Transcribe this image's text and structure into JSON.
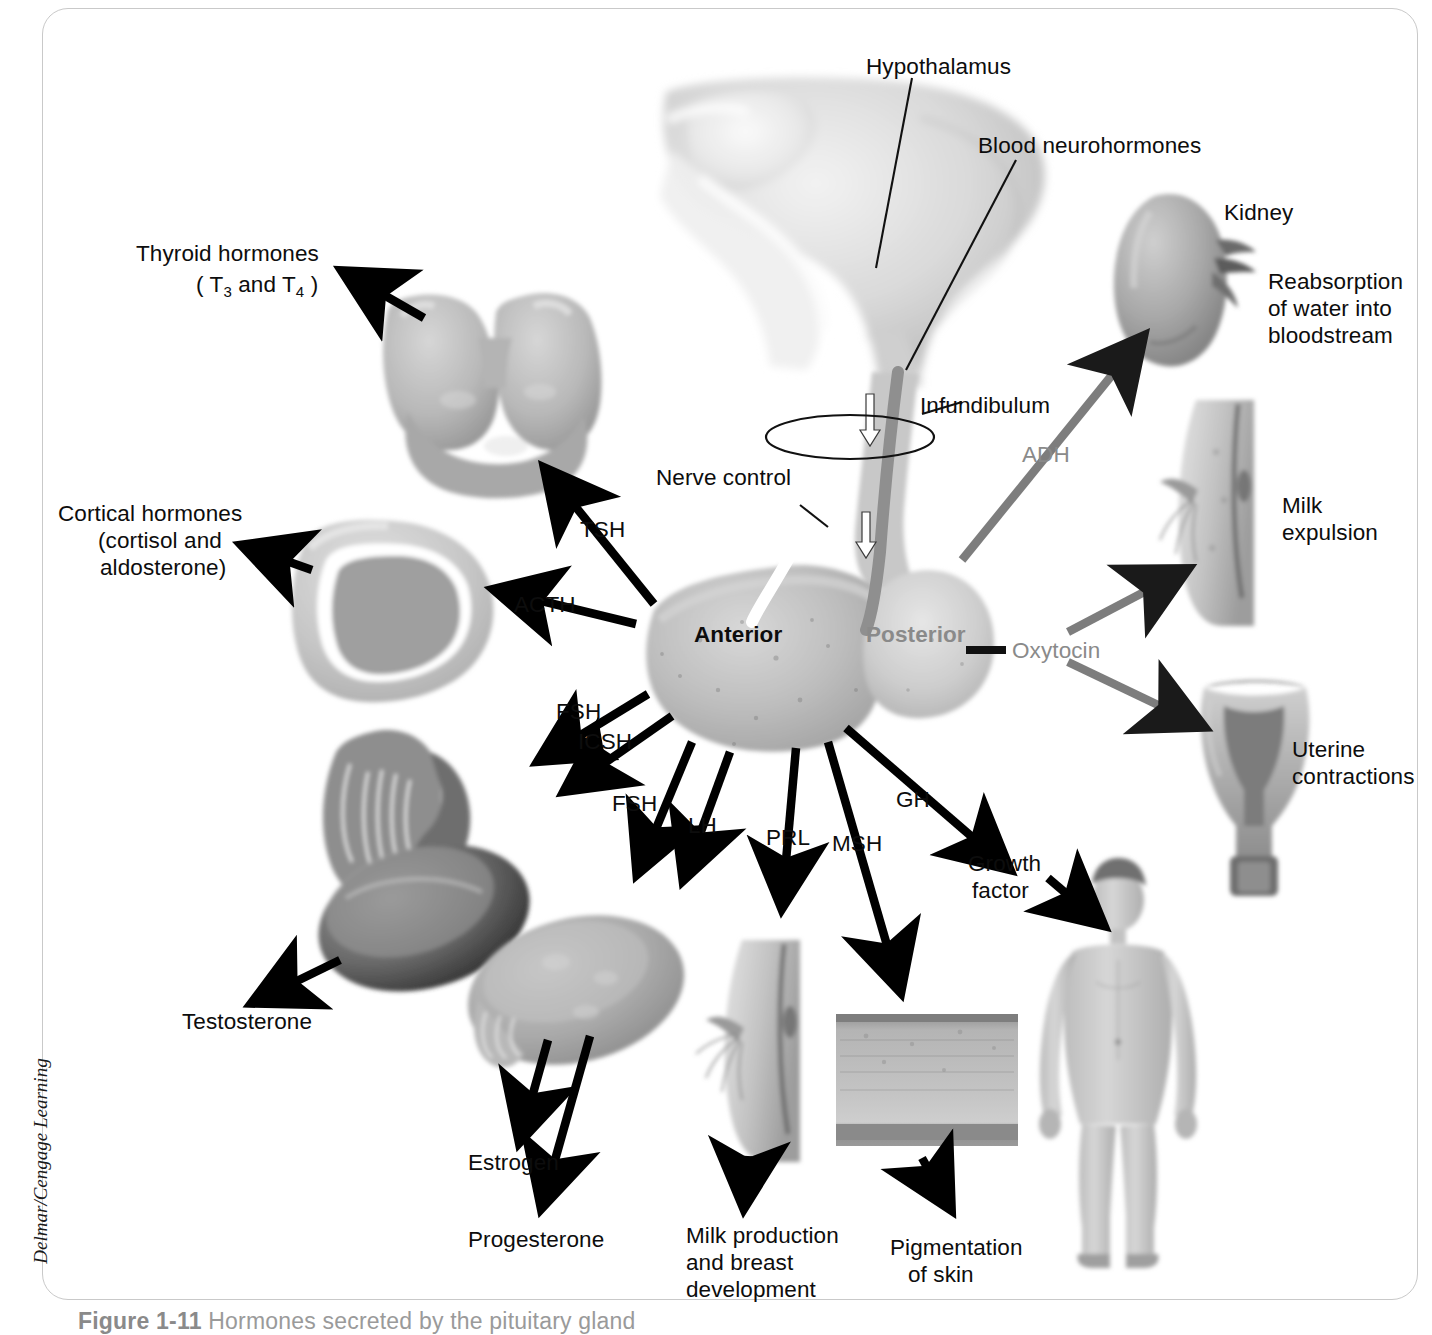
{
  "figure": {
    "credit": "Delmar/Cengage Learning",
    "caption_number": "Figure 1-11",
    "caption_text": "Hormones secreted by the pituitary gland"
  },
  "colors": {
    "ink": "#0d0d0d",
    "posterior_gray": "#8a8a8a",
    "anterior_black": "#0d0d0d",
    "arrow_black": "#000000",
    "arrow_gray": "#7d7d7d",
    "frame": "#c9c9c9"
  },
  "structures": {
    "hypothalamus": "Hypothalamus",
    "blood_neurohormones": "Blood neurohormones",
    "infundibulum": "Infundibulum",
    "nerve_control": "Nerve control",
    "anterior_lobe": "Anterior",
    "posterior_lobe": "Posterior",
    "kidney": "Kidney"
  },
  "anterior_hormones": [
    {
      "abbr": "TSH",
      "target": "Thyroid gland",
      "effect_line1": "Thyroid hormones",
      "effect_line2": "( T3 and T4 )"
    },
    {
      "abbr": "ACTH",
      "target": "Adrenal cortex",
      "effect_line1": "Cortical hormones",
      "effect_line2": "(cortisol and",
      "effect_line3": "aldosterone)"
    },
    {
      "abbr": "FSH",
      "target": "Testis",
      "effect_line1": "Testosterone"
    },
    {
      "abbr": "ICSH",
      "target": "Testis",
      "effect_line1": "Testosterone"
    },
    {
      "abbr": "FSH",
      "target": "Ovary",
      "effect_line1": "Estrogen"
    },
    {
      "abbr": "LH",
      "target": "Ovary",
      "effect_line1": "Progesterone"
    },
    {
      "abbr": "PRL",
      "target": "Breast",
      "effect_line1": "Milk production",
      "effect_line2": "and breast",
      "effect_line3": "development"
    },
    {
      "abbr": "MSH",
      "target": "Skin",
      "effect_line1": "Pigmentation",
      "effect_line2": "of skin"
    },
    {
      "abbr": "GH",
      "target": "Body",
      "effect_line1": "Growth",
      "effect_line2": "factor"
    }
  ],
  "posterior_hormones": [
    {
      "abbr": "ADH",
      "target": "Kidney",
      "effect_line1": "Reabsorption",
      "effect_line2": "of water into",
      "effect_line3": "bloodstream"
    },
    {
      "abbr": "Oxytocin",
      "target": "Breast",
      "effect_line1": "Milk",
      "effect_line2": "expulsion"
    },
    {
      "abbr": "Oxytocin",
      "target": "Uterus",
      "effect_line1": "Uterine",
      "effect_line2": "contractions"
    }
  ],
  "labels": {
    "thyroid_l1": "Thyroid hormones",
    "thyroid_l2_a": "( T",
    "thyroid_l2_sub1": "3",
    "thyroid_l2_b": " and T",
    "thyroid_l2_sub2": "4",
    "thyroid_l2_c": " )",
    "cortical_l1": "Cortical hormones",
    "cortical_l2": "(cortisol and",
    "cortical_l3": "aldosterone)",
    "tsh": "TSH",
    "acth": "ACTH",
    "fsh_testis": "FSH",
    "icsh": "ICSH",
    "fsh_ovary": "FSH",
    "lh": "LH",
    "prl": "PRL",
    "msh": "MSH",
    "gh": "GH",
    "adh": "ADH",
    "oxytocin": "Oxytocin",
    "testosterone": "Testosterone",
    "estrogen": "Estrogen",
    "progesterone": "Progesterone",
    "milk_prod_l1": "Milk production",
    "milk_prod_l2": "and breast",
    "milk_prod_l3": "development",
    "pigment_l1": "Pigmentation",
    "pigment_l2": "of skin",
    "growth_l1": "Growth",
    "growth_l2": "factor",
    "kidney": "Kidney",
    "reabsorb_l1": "Reabsorption",
    "reabsorb_l2": "of water into",
    "reabsorb_l3": "bloodstream",
    "milk_exp_l1": "Milk",
    "milk_exp_l2": "expulsion",
    "uterine_l1": "Uterine",
    "uterine_l2": "contractions",
    "hypothalamus": "Hypothalamus",
    "blood_neuro": "Blood neurohormones",
    "infundibulum": "Infundibulum",
    "nerve_control": "Nerve control",
    "anterior": "Anterior",
    "posterior": "Posterior"
  }
}
